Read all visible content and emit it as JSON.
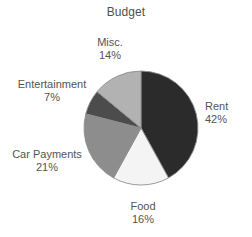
{
  "chart_data": {
    "type": "pie",
    "title": "Budget",
    "xlabel": "",
    "ylabel": "",
    "legend": "none",
    "grid": false,
    "start_angle_deg": 0,
    "direction": "clockwise",
    "categories": [
      "Rent",
      "Food",
      "Car Payments",
      "Entertainment",
      "Misc."
    ],
    "values": [
      42,
      16,
      21,
      7,
      14
    ],
    "value_unit": "%",
    "slices": [
      {
        "label": "Rent",
        "value": 42,
        "value_text": "42%",
        "color": "#2b2b2b",
        "label_align": "left"
      },
      {
        "label": "Food",
        "value": 16,
        "value_text": "16%",
        "color": "#f4f4f4",
        "label_align": "center"
      },
      {
        "label": "Car Payments",
        "value": 21,
        "value_text": "21%",
        "color": "#8d8d8d",
        "label_align": "center"
      },
      {
        "label": "Entertainment",
        "value": 7,
        "value_text": "7%",
        "color": "#4c4c4c",
        "label_align": "center"
      },
      {
        "label": "Misc.",
        "value": 14,
        "value_text": "14%",
        "color": "#b2b2b2",
        "label_align": "center"
      }
    ],
    "geometry": {
      "center_x": 141,
      "center_y": 128,
      "radius": 57
    },
    "colors": {
      "background": "#ffffff",
      "outline": "#8f8f8f",
      "text": "#545454"
    }
  }
}
